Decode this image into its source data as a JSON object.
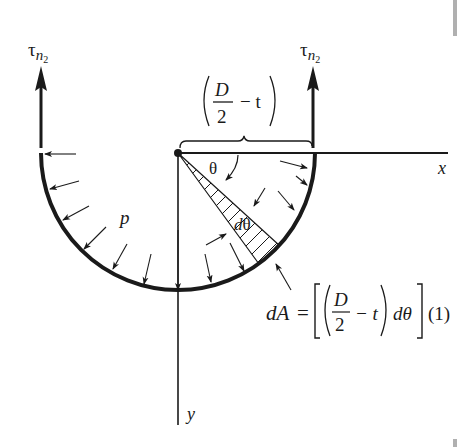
{
  "diagram": {
    "labels": {
      "tau_left": "τ",
      "tau_left_sub": "n",
      "tau_left_subsub": "2",
      "tau_right": "τ",
      "tau_right_sub": "n",
      "tau_right_subsub": "2",
      "radius_num": "D",
      "radius_den": "2",
      "radius_minus": "− t",
      "x_axis": "x",
      "y_axis": "y",
      "theta": "θ",
      "dtheta": "dθ",
      "pressure": "p",
      "dA_lhs": "dA",
      "dA_eq": "=",
      "dA_num": "D",
      "dA_den": "2",
      "dA_minus_t": "− t",
      "dA_dtheta": "dθ",
      "dA_unit": "(1)"
    },
    "colors": {
      "ink": "#1a1a1a",
      "background": "#ffffff",
      "scrollbar": "#b0b0b0"
    }
  }
}
